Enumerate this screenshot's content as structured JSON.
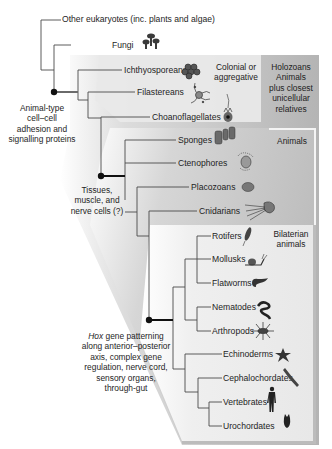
{
  "diagram": {
    "type": "phylogenetic-tree",
    "taxa": [
      {
        "id": "other_eukaryotes",
        "label": "Other eukaryotes (inc. plants and algae)"
      },
      {
        "id": "fungi",
        "label": "Fungi"
      },
      {
        "id": "ichthyosporeans",
        "label": "Ichthyosporeans"
      },
      {
        "id": "filastereans",
        "label": "Filastereans"
      },
      {
        "id": "choanoflagellates",
        "label": "Choanoflagellates"
      },
      {
        "id": "sponges",
        "label": "Sponges"
      },
      {
        "id": "ctenophores",
        "label": "Ctenophores"
      },
      {
        "id": "placozoans",
        "label": "Placozoans"
      },
      {
        "id": "cnidarians",
        "label": "Cnidarians"
      },
      {
        "id": "rotifers",
        "label": "Rotifers"
      },
      {
        "id": "mollusks",
        "label": "Mollusks"
      },
      {
        "id": "flatworms",
        "label": "Flatworms"
      },
      {
        "id": "nematodes",
        "label": "Nematodes"
      },
      {
        "id": "arthropods",
        "label": "Arthropods"
      },
      {
        "id": "echinoderms",
        "label": "Echinoderms"
      },
      {
        "id": "cephalochordates",
        "label": "Cephalochordates"
      },
      {
        "id": "vertebrates",
        "label": "Vertebrates"
      },
      {
        "id": "urochordates",
        "label": "Urochordates"
      }
    ],
    "groups": {
      "colonial": {
        "label_line1": "Colonial or",
        "label_line2": "aggregative"
      },
      "holozoans": {
        "title": "Holozoans",
        "desc_line1": "Animals",
        "desc_line2": "plus closest",
        "desc_line3": "unicellular",
        "desc_line4": "relatives"
      },
      "animals": {
        "title": "Animals"
      },
      "bilaterians": {
        "label_line1": "Bilaterian",
        "label_line2": "animals"
      }
    },
    "innovations": {
      "animal_type": {
        "line1": "Animal-type",
        "line2": "cell–cell",
        "line3": "adhesion and",
        "line4": "signalling proteins"
      },
      "tissues": {
        "line1": "Tissues,",
        "line2": "muscle, and",
        "line3": "nerve cells (?)"
      },
      "hox": {
        "line1_italic": "Hox",
        "line1_rest": " gene patterning",
        "line2": "along anterior–posterior",
        "line3": "axis, complex gene",
        "line4": "regulation, nerve cord,",
        "line5": "sensory organs,",
        "line6": "through-gut"
      }
    },
    "colors": {
      "branch": "#4a4a4a",
      "node": "#111111",
      "holozoan_panel": "#b9b9b9",
      "colonial_box": "#e6e6e6",
      "animals_panel": "#c8c8c8",
      "bilaterian_panel": "#ececec"
    }
  }
}
